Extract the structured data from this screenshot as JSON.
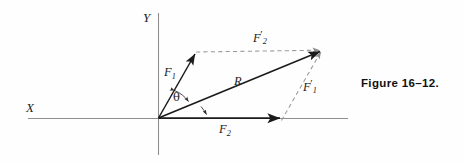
{
  "figure": {
    "caption": "Figure  16–12.",
    "background_color": "#fefefe",
    "axis_color": "#8c8c8c",
    "vector_color": "#1b1b1b",
    "dashed_color": "#9a9a9a"
  },
  "axes": {
    "x_label": "X",
    "y_label": "Y",
    "origin": {
      "x": 158,
      "y": 118
    },
    "x_axis": {
      "x1": 28,
      "y1": 118,
      "x2": 348,
      "y2": 118
    },
    "y_axis": {
      "x1": 158,
      "y1": 13,
      "x2": 158,
      "y2": 155
    }
  },
  "vectors": [
    {
      "name": "F1",
      "label_main": "F",
      "label_sub": "1",
      "label_prime": "",
      "style": "solid",
      "from": {
        "x": 158,
        "y": 118
      },
      "to": {
        "x": 196,
        "y": 52
      }
    },
    {
      "name": "F2",
      "label_main": "F",
      "label_sub": "2",
      "label_prime": "",
      "style": "solid",
      "from": {
        "x": 158,
        "y": 118
      },
      "to": {
        "x": 283,
        "y": 118
      }
    },
    {
      "name": "R",
      "label_main": "R",
      "label_sub": "",
      "label_prime": "",
      "style": "solid",
      "from": {
        "x": 158,
        "y": 118
      },
      "to": {
        "x": 322,
        "y": 50
      }
    },
    {
      "name": "F2-prime",
      "label_main": "F",
      "label_sub": "2",
      "label_prime": "′",
      "style": "dashed",
      "from": {
        "x": 196,
        "y": 52
      },
      "to": {
        "x": 322,
        "y": 50
      }
    },
    {
      "name": "F1-prime",
      "label_main": "F",
      "label_sub": "1",
      "label_prime": "′",
      "style": "dashed",
      "from": {
        "x": 283,
        "y": 118
      },
      "to": {
        "x": 322,
        "y": 50
      }
    }
  ],
  "angles": [
    {
      "name": "theta",
      "label": "θ",
      "between": "F1 and R",
      "description": "double-headed arc between F1 and R"
    },
    {
      "name": "angle-r-x",
      "label": "",
      "between": "R and X axis",
      "description": "arc with arrowhead between R and the X axis"
    }
  ]
}
